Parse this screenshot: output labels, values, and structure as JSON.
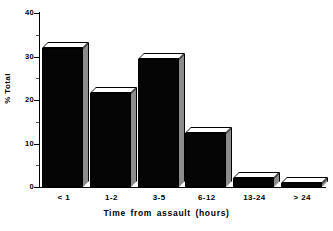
{
  "chart_data": {
    "type": "bar",
    "title": "",
    "xlabel": "Time from assault (hours)",
    "ylabel": "% Total",
    "categories": [
      "< 1",
      "1-2",
      "3-5",
      "6-12",
      "13-24",
      "> 24"
    ],
    "values": [
      32,
      21.5,
      29.5,
      12.5,
      2,
      1
    ],
    "ylim": [
      0,
      40
    ],
    "yticks": [
      0,
      10,
      20,
      30,
      40
    ],
    "ytick_labels": [
      "0",
      "10",
      "20",
      "30",
      "40"
    ],
    "yminor_ticks": [
      5,
      15,
      25,
      35
    ],
    "grid": false,
    "legend": null,
    "style": "3d-bar",
    "colors": {
      "bar_front": "#050505",
      "bar_top": "#ffffff",
      "bar_side": "#8c8c8c",
      "axis": "#000000",
      "background": "#ffffff"
    }
  }
}
